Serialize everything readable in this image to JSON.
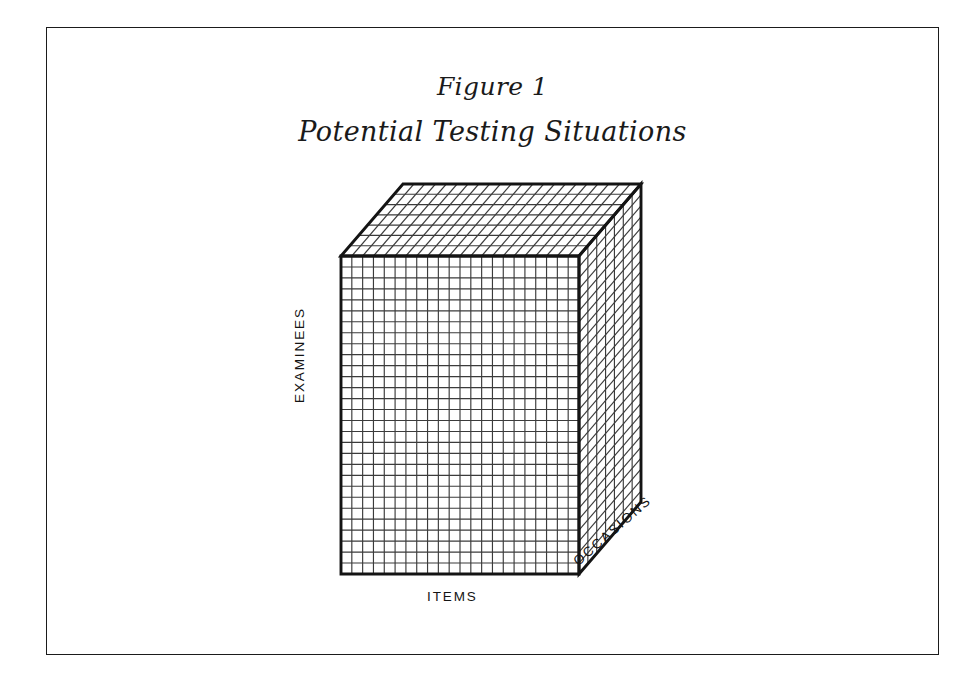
{
  "figure": {
    "number": "Figure 1",
    "title": "Potential Testing Situations"
  },
  "diagram": {
    "type": "3d-cube-grid",
    "axes": {
      "vertical_label": "EXAMINEES",
      "horizontal_label": "ITEMS",
      "depth_label": "OCCASIONS"
    },
    "geometry": {
      "front_face": {
        "left": 294,
        "top": 228,
        "width": 238,
        "height": 318,
        "columns": 22,
        "rows": 29
      },
      "depth_offset": {
        "dx": 62,
        "dy": -72
      },
      "depth_divisions": 7
    },
    "colors": {
      "line": "#1b1b1b",
      "grid_line": "#3a3a3a",
      "background": "#ffffff"
    }
  }
}
